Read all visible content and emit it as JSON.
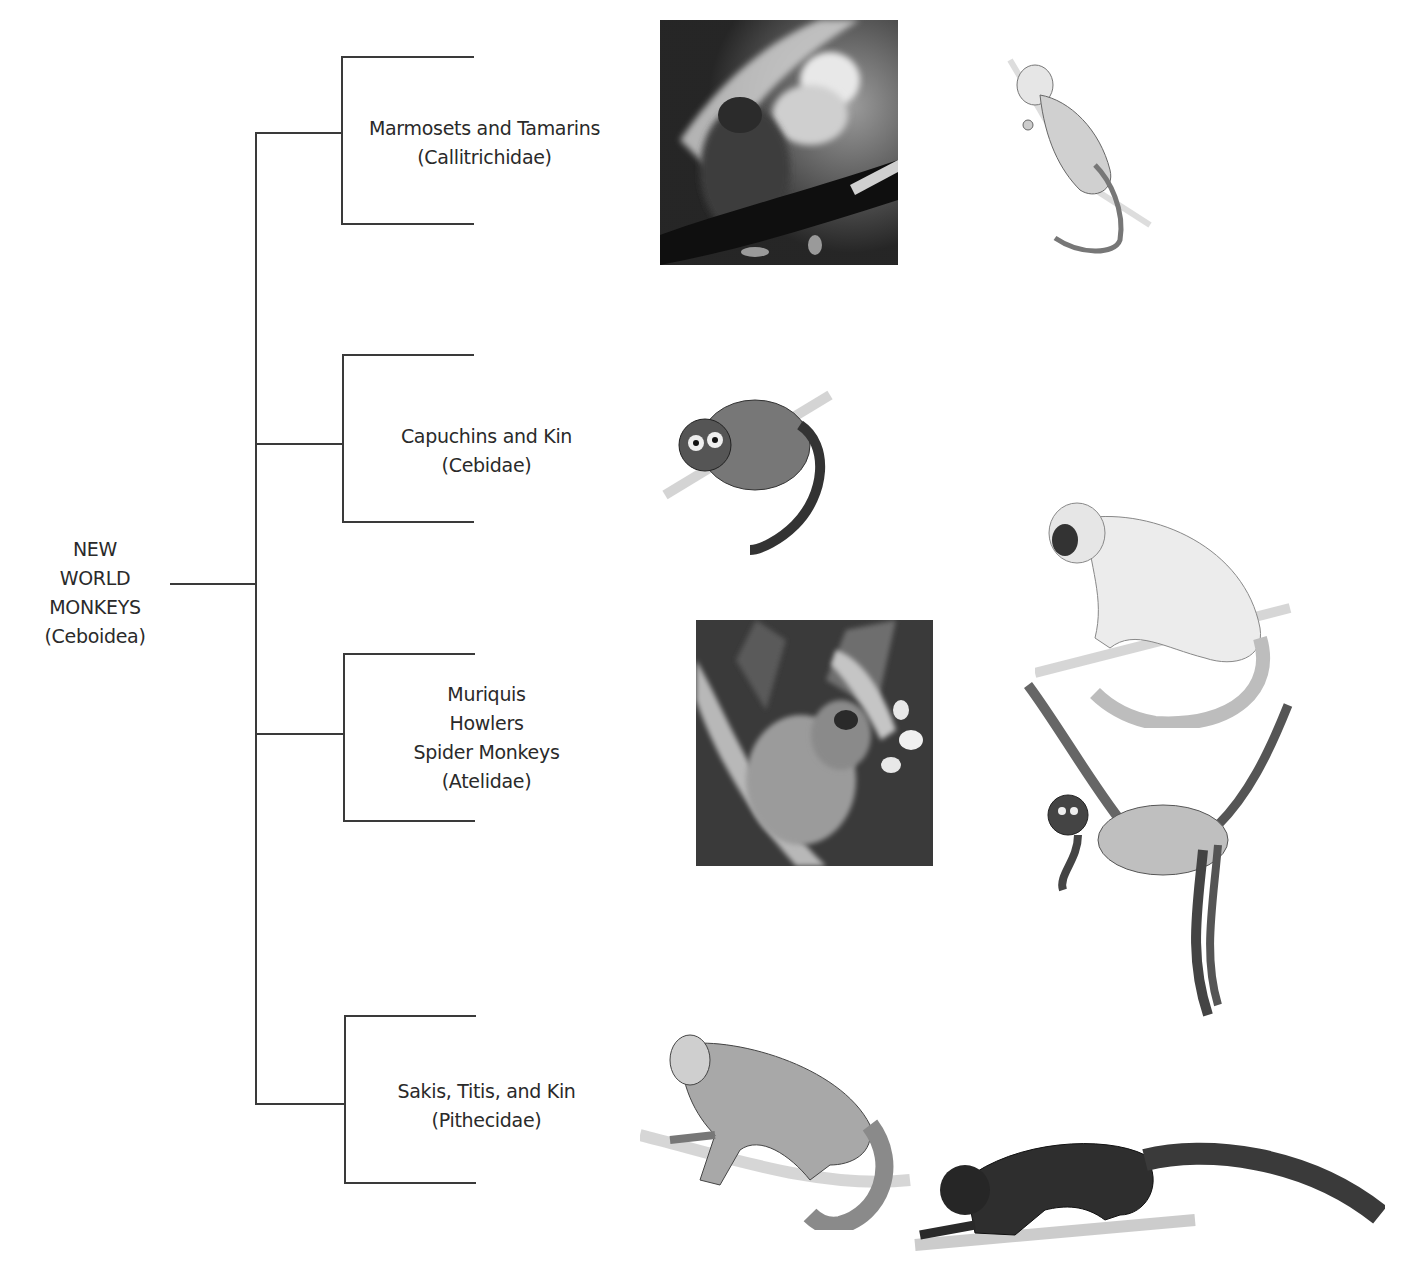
{
  "root": {
    "lines": [
      "NEW",
      "WORLD",
      "MONKEYS",
      "(Ceboidea)"
    ]
  },
  "families": [
    {
      "id": "callitrichidae",
      "lines": [
        "Marmosets and Tamarins",
        "(Callitrichidae)"
      ],
      "images": [
        "marmoset-photo",
        "tamarin-drawing"
      ]
    },
    {
      "id": "cebidae",
      "lines": [
        "Capuchins and Kin",
        "(Cebidae)"
      ],
      "images": [
        "owl-monkey-drawing"
      ]
    },
    {
      "id": "atelidae",
      "lines": [
        "Muriquis",
        "Howlers",
        "Spider Monkeys",
        "(Atelidae)"
      ],
      "images": [
        "muriqui-photo",
        "howler-drawing",
        "spider-monkey-drawing"
      ]
    },
    {
      "id": "pithecidae",
      "lines": [
        "Sakis, Titis, and Kin",
        "(Pithecidae)"
      ],
      "images": [
        "saki-drawing",
        "uakari-drawing"
      ]
    }
  ]
}
